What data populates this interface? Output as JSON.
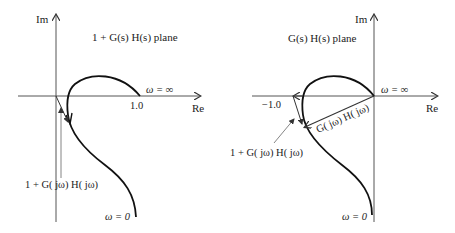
{
  "left_plot": {
    "title": "1 + G(s) H(s) plane",
    "axis_im": "Im",
    "axis_re": "Re",
    "tick_one": "1.0",
    "omega_inf": "ω = ∞",
    "omega_zero": "ω = 0",
    "vector_label": "1 + G( jω) H( jω)"
  },
  "right_plot": {
    "title": "G(s) H(s) plane",
    "axis_im": "Im",
    "axis_re": "Re",
    "tick_minus_one": "−1.0",
    "omega_inf": "ω = ∞",
    "omega_zero": "ω = 0",
    "vector_label_gh": "G( jω) H( jω)",
    "vector_label_sum": "1 + G( jω) H( jω)"
  },
  "colors": {
    "curve": "#111111",
    "axis": "#555555",
    "text": "#222222"
  }
}
